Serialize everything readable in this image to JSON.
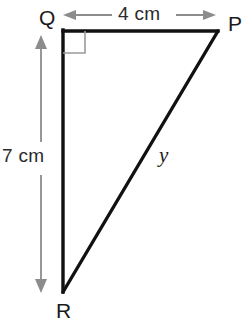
{
  "diagram": {
    "shape": "right-triangle",
    "background_color": "#ffffff",
    "stroke_color": "#111111",
    "annotation_color": "#8c8c8c",
    "text_color": "#1a1a1a",
    "vertices": {
      "Q": {
        "label": "Q",
        "x": 63,
        "y": 31
      },
      "P": {
        "label": "P",
        "x": 218,
        "y": 31
      },
      "R": {
        "label": "R",
        "x": 63,
        "y": 292
      }
    },
    "right_angle": {
      "at_vertex": "Q",
      "marker": "square",
      "size": 22,
      "color": "#9a9a9a"
    },
    "sides": {
      "top": {
        "name": "QP",
        "label": "4 cm",
        "value": 4,
        "unit": "cm"
      },
      "left": {
        "name": "QR",
        "label": "7 cm",
        "value": 7,
        "unit": "cm"
      },
      "hypotenuse": {
        "name": "PR",
        "label": "y",
        "value": null,
        "unit": "cm"
      }
    },
    "dimension_arrows": {
      "top": {
        "orientation": "horizontal",
        "x1": 65,
        "x2": 215,
        "y": 15,
        "double_headed": true,
        "color": "#8c8c8c"
      },
      "left": {
        "orientation": "vertical",
        "y1": 36,
        "y2": 292,
        "x": 41,
        "double_headed": true,
        "color": "#8c8c8c"
      }
    }
  }
}
